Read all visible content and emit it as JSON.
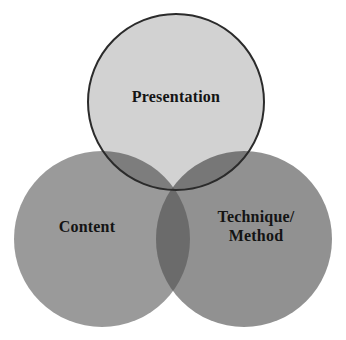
{
  "diagram": {
    "type": "venn",
    "title": "",
    "background_color": "#ffffff",
    "outline_color": "#2b2b2b",
    "text_color": "#141414",
    "sets": [
      {
        "id": "presentation",
        "label": "Presentation",
        "position": "top",
        "fill_color": "#d2d2d2",
        "center_x": 176,
        "center_y": 102,
        "radius": 88,
        "has_outline": true
      },
      {
        "id": "content",
        "label": "Content",
        "position": "bottom-left",
        "fill_color": "#9a9a9a",
        "center_x": 102,
        "center_y": 239,
        "radius": 88,
        "has_outline": false
      },
      {
        "id": "technique-method",
        "label_line_1": "Technique/",
        "label_line_2": "Method",
        "label": "Technique/ Method",
        "position": "bottom-right",
        "fill_color": "#919191",
        "center_x": 244,
        "center_y": 239,
        "radius": 88,
        "has_outline": false
      }
    ],
    "overlaps": [
      {
        "id": "presentation-content",
        "fill_color": "#7d7d7d"
      },
      {
        "id": "presentation-technique",
        "fill_color": "#777777"
      },
      {
        "id": "content-technique",
        "fill_color": "#6b6b6b"
      },
      {
        "id": "all-three",
        "fill_color": "#636363"
      }
    ]
  }
}
